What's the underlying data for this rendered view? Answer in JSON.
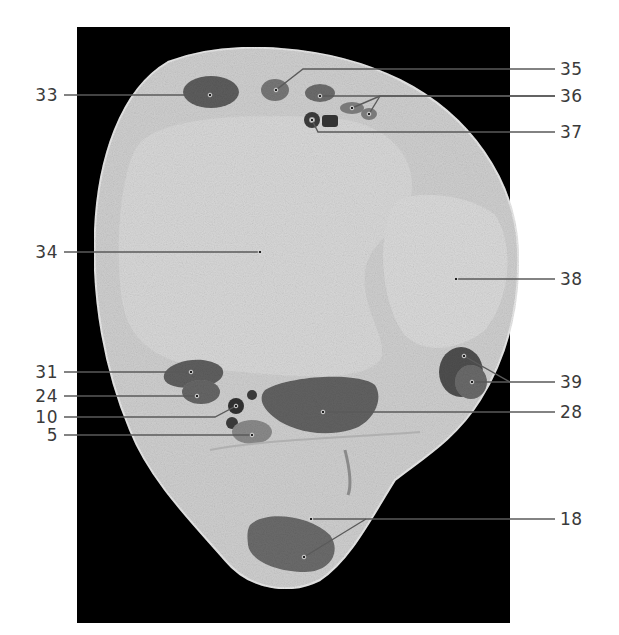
{
  "figure": {
    "type": "anatomical cross-section (labeled)",
    "background_color": "#000000",
    "tissue_color": "#c9c9c9",
    "muscle_color": "#6e6e6e",
    "leader_color": "#555555"
  },
  "labels": {
    "left": [
      {
        "id": "33",
        "text": "33",
        "y": 95
      },
      {
        "id": "34",
        "text": "34",
        "y": 252
      },
      {
        "id": "31",
        "text": "31",
        "y": 372
      },
      {
        "id": "24",
        "text": "24",
        "y": 396
      },
      {
        "id": "10",
        "text": "10",
        "y": 417
      },
      {
        "id": "5",
        "text": "5",
        "y": 435
      }
    ],
    "right": [
      {
        "id": "35",
        "text": "35",
        "y": 69
      },
      {
        "id": "36",
        "text": "36",
        "y": 96
      },
      {
        "id": "37",
        "text": "37",
        "y": 132
      },
      {
        "id": "38",
        "text": "38",
        "y": 279
      },
      {
        "id": "39",
        "text": "39",
        "y": 382
      },
      {
        "id": "28",
        "text": "28",
        "y": 412
      },
      {
        "id": "18",
        "text": "18",
        "y": 519
      }
    ]
  }
}
